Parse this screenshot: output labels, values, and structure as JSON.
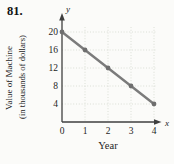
{
  "problem_number": "81.",
  "chart_data": {
    "type": "line",
    "x": [
      0,
      1,
      2,
      3,
      4
    ],
    "y": [
      20,
      16,
      12,
      8,
      4
    ],
    "series": [
      {
        "name": "Value of Machine",
        "values": [
          20,
          16,
          12,
          8,
          4
        ]
      }
    ],
    "title": "",
    "xlabel": "Year",
    "ylabel_line1": "Value of Machine",
    "ylabel_line2": "(in thousands of dollars)",
    "x_axis_letter": "x",
    "y_axis_letter": "y",
    "x_ticks": [
      0,
      1,
      2,
      3,
      4
    ],
    "y_ticks": [
      4,
      8,
      12,
      16,
      20
    ],
    "xlim": [
      0,
      4
    ],
    "ylim": [
      0,
      22
    ],
    "grid": true,
    "legend": "none",
    "colors": {
      "line": "#7b7b7b",
      "point": "#6e6e6e",
      "axis": "#3f3f3f",
      "gridline": "#d8ddd2",
      "text": "#1e1e1e"
    }
  }
}
